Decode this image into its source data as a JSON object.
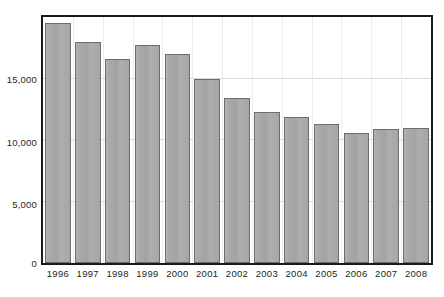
{
  "chart_data": {
    "type": "bar",
    "title": "",
    "subtitle": "",
    "xlabel": "",
    "ylabel": "",
    "categories": [
      "1996",
      "1997",
      "1998",
      "1999",
      "2000",
      "2001",
      "2002",
      "2003",
      "2004",
      "2005",
      "2006",
      "2007",
      "2008"
    ],
    "values": [
      19500,
      18000,
      16600,
      17700,
      17000,
      15000,
      13400,
      12300,
      11900,
      11300,
      10600,
      10900,
      11000
    ],
    "series": [
      {
        "name": "",
        "values": [
          19500,
          18000,
          16600,
          17700,
          17000,
          15000,
          13400,
          12300,
          11900,
          11300,
          10600,
          10900,
          11000
        ]
      }
    ],
    "ylim": [
      0,
      20000
    ],
    "xlim_categories": 13,
    "ytick_values": [
      0,
      5000,
      10000,
      15000
    ],
    "ytick_labels": [
      "0",
      "5,000",
      "10,000",
      "15,000"
    ],
    "grid": {
      "horizontal": true,
      "vertical": true,
      "horizontal_color": "#d9d9d9",
      "vertical_color": "#ededed"
    },
    "legend": {
      "visible": false,
      "position": "none",
      "entries": []
    },
    "annotations": [],
    "data_labels_visible": false,
    "colors": {
      "bar_fill": "#a9a9a9",
      "bar_border": "#6e6e6e",
      "frame": "#1a1a1a",
      "background": "#ffffff",
      "text": "#231f20"
    }
  }
}
